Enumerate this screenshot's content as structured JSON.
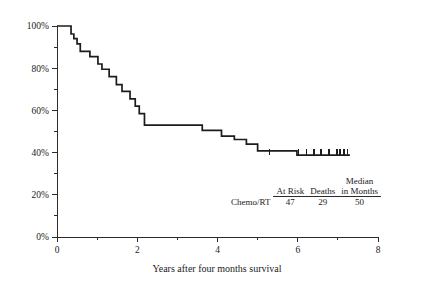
{
  "chart_data": {
    "type": "line",
    "subtype": "kaplan-meier-survival",
    "title": "",
    "xlabel": "Years after four months survival",
    "ylabel": "",
    "xlim": [
      0,
      8
    ],
    "ylim": [
      0,
      1
    ],
    "grid": false,
    "legend": "none",
    "x_ticks_major": [
      0,
      2,
      4,
      6,
      8
    ],
    "x_tick_labels": [
      "0",
      "2",
      "4",
      "6",
      "8"
    ],
    "x_ticks_minor": [
      1,
      3,
      5,
      7
    ],
    "y_ticks_major": [
      0,
      0.2,
      0.4,
      0.6,
      0.8,
      1.0
    ],
    "y_tick_labels": [
      "0%",
      "20%",
      "40%",
      "60%",
      "80%",
      "100%"
    ],
    "y_ticks_minor": [
      0.1,
      0.3,
      0.5,
      0.7,
      0.9
    ],
    "series": [
      {
        "name": "Chemo/RT",
        "color": "#1c1c1c",
        "step_points": [
          [
            0.0,
            1.0
          ],
          [
            0.35,
            1.0
          ],
          [
            0.35,
            0.962
          ],
          [
            0.42,
            0.962
          ],
          [
            0.42,
            0.94
          ],
          [
            0.5,
            0.94
          ],
          [
            0.5,
            0.915
          ],
          [
            0.58,
            0.915
          ],
          [
            0.58,
            0.88
          ],
          [
            0.82,
            0.88
          ],
          [
            0.82,
            0.855
          ],
          [
            1.02,
            0.855
          ],
          [
            1.02,
            0.82
          ],
          [
            1.12,
            0.82
          ],
          [
            1.12,
            0.795
          ],
          [
            1.3,
            0.795
          ],
          [
            1.3,
            0.76
          ],
          [
            1.48,
            0.76
          ],
          [
            1.48,
            0.722
          ],
          [
            1.62,
            0.722
          ],
          [
            1.62,
            0.69
          ],
          [
            1.82,
            0.69
          ],
          [
            1.82,
            0.655
          ],
          [
            1.95,
            0.655
          ],
          [
            1.95,
            0.62
          ],
          [
            2.05,
            0.62
          ],
          [
            2.05,
            0.585
          ],
          [
            2.18,
            0.585
          ],
          [
            2.18,
            0.53
          ],
          [
            3.62,
            0.53
          ],
          [
            3.62,
            0.505
          ],
          [
            4.1,
            0.505
          ],
          [
            4.1,
            0.478
          ],
          [
            4.42,
            0.478
          ],
          [
            4.42,
            0.462
          ],
          [
            4.72,
            0.462
          ],
          [
            4.72,
            0.44
          ],
          [
            5.0,
            0.44
          ],
          [
            5.0,
            0.408
          ],
          [
            5.98,
            0.408
          ],
          [
            5.98,
            0.388
          ],
          [
            7.3,
            0.388
          ]
        ],
        "censor_times": [
          5.3,
          6.02,
          6.22,
          6.4,
          6.58,
          6.78,
          6.98,
          7.06,
          7.16,
          7.24
        ],
        "censor_value": 0.388
      }
    ]
  },
  "risk_table": {
    "column_headers": [
      "At Risk",
      "Deaths",
      "Median in Months"
    ],
    "median_header_line1": "Median",
    "median_header_line2": "in Months",
    "at_risk_header": "At Risk",
    "deaths_header": "Deaths",
    "rows": [
      {
        "label": "Chemo/RT",
        "at_risk": "47",
        "deaths": "29",
        "median_months": "50"
      }
    ]
  }
}
